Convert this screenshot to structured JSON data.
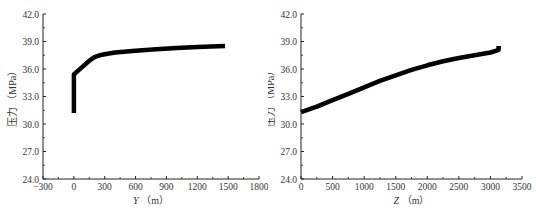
{
  "chart_data": [
    {
      "type": "line",
      "title": "",
      "xlabel": "Y (m)",
      "ylabel": "压力 (MPa)",
      "xlim": [
        -300,
        1800
      ],
      "ylim": [
        24.0,
        42.0
      ],
      "x_ticks": [
        "-300",
        "0",
        "300",
        "600",
        "900",
        "1200",
        "1500",
        "1800"
      ],
      "y_ticks": [
        "24.0",
        "27.0",
        "30.0",
        "33.0",
        "36.0",
        "39.0",
        "42.0"
      ],
      "grid": false,
      "legend": null,
      "series": [
        {
          "name": "pressure-vs-Y",
          "color": "#000000",
          "x": [
            0,
            0,
            50,
            100,
            150,
            200,
            250,
            300,
            400,
            600,
            800,
            1000,
            1200,
            1470
          ],
          "y": [
            31.2,
            35.4,
            35.9,
            36.4,
            36.9,
            37.3,
            37.5,
            37.6,
            37.8,
            38.0,
            38.15,
            38.3,
            38.4,
            38.5
          ]
        }
      ]
    },
    {
      "type": "line",
      "title": "",
      "xlabel": "Z (m)",
      "ylabel": "压力 (MPa)",
      "xlim": [
        0,
        3500
      ],
      "ylim": [
        24.0,
        42.0
      ],
      "x_ticks": [
        "0",
        "500",
        "1000",
        "1500",
        "2000",
        "2500",
        "3000",
        "3500"
      ],
      "y_ticks": [
        "24.0",
        "27.0",
        "30.0",
        "33.0",
        "36.0",
        "39.0",
        "42.0"
      ],
      "grid": false,
      "legend": null,
      "series": [
        {
          "name": "pressure-vs-Z",
          "color": "#000000",
          "x": [
            0,
            250,
            500,
            750,
            1000,
            1250,
            1500,
            1750,
            2000,
            2250,
            2500,
            2750,
            3000,
            3100,
            3130,
            3130
          ],
          "y": [
            31.3,
            31.9,
            32.6,
            33.3,
            34.0,
            34.7,
            35.3,
            35.9,
            36.4,
            36.85,
            37.2,
            37.5,
            37.8,
            38.0,
            38.1,
            38.5
          ]
        }
      ]
    }
  ]
}
